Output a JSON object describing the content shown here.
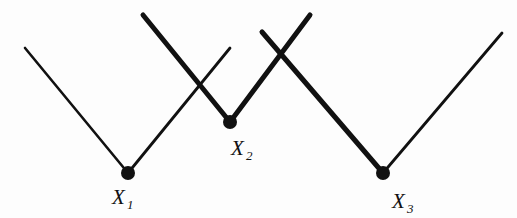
{
  "figure": {
    "background_color": "#fdfdfd",
    "stroke_color": "#111111",
    "width": 517,
    "height": 218
  },
  "chart_data": {
    "type": "line",
    "title": "",
    "xlabel": "",
    "ylabel": "",
    "grid": false,
    "legend": null,
    "xlim": [
      0,
      517
    ],
    "ylim": [
      218,
      0
    ],
    "nodes": [
      {
        "id": "X1",
        "label": "X",
        "subscript": "1",
        "x": 128,
        "y": 173,
        "marker": "filled-circle",
        "marker_radius": 7
      },
      {
        "id": "X2",
        "label": "X",
        "subscript": "2",
        "x": 230,
        "y": 122,
        "marker": "filled-circle",
        "marker_radius": 7
      },
      {
        "id": "X3",
        "label": "X",
        "subscript": "3",
        "x": 383,
        "y": 173,
        "marker": "filled-circle",
        "marker_radius": 7
      }
    ],
    "label_positions": [
      {
        "id": "X1",
        "x": 112,
        "y": 204,
        "sub_x": 127,
        "sub_y": 209
      },
      {
        "id": "X2",
        "x": 231,
        "y": 155,
        "sub_x": 246,
        "sub_y": 160
      },
      {
        "id": "X3",
        "x": 392,
        "y": 208,
        "sub_x": 407,
        "sub_y": 213
      }
    ],
    "segments": [
      {
        "id": "seg-left-thin",
        "x1": 25,
        "y1": 48,
        "x2": 128,
        "y2": 173,
        "weight": "thin",
        "width": 2.6
      },
      {
        "id": "seg-x1-up-right-thin",
        "x1": 128,
        "y1": 173,
        "x2": 230,
        "y2": 48,
        "weight": "thin",
        "width": 2.8
      },
      {
        "id": "seg-peak1-to-x2",
        "x1": 143,
        "y1": 15,
        "x2": 230,
        "y2": 122,
        "weight": "thick",
        "width": 5.0
      },
      {
        "id": "seg-x2-to-peak2",
        "x1": 230,
        "y1": 122,
        "x2": 310,
        "y2": 15,
        "weight": "thick",
        "width": 5.0
      },
      {
        "id": "seg-peak3-to-x3",
        "x1": 262,
        "y1": 32,
        "x2": 383,
        "y2": 173,
        "weight": "thick",
        "width": 5.0
      },
      {
        "id": "seg-x3-right-thin",
        "x1": 383,
        "y1": 173,
        "x2": 502,
        "y2": 33,
        "weight": "thin",
        "width": 2.8
      }
    ],
    "crossings": [
      {
        "id": "crossing-left",
        "x": 202,
        "y": 85
      },
      {
        "id": "crossing-right",
        "x": 285,
        "y": 53
      }
    ]
  }
}
